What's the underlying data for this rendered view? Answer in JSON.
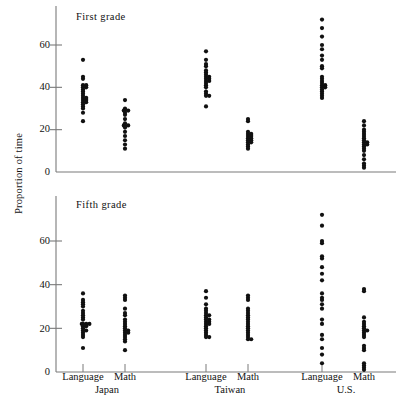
{
  "figure": {
    "ylabel": "Proportion of time",
    "panels": [
      {
        "id": "first",
        "title": "First grade"
      },
      {
        "id": "fifth",
        "title": "Fifth grade"
      }
    ],
    "ytick_labels": [
      "0",
      "20",
      "40",
      "60"
    ],
    "group_labels": [
      "Language",
      "Math",
      "Language",
      "Math",
      "Language",
      "Math"
    ],
    "country_labels": [
      "Japan",
      "Taiwan",
      "U.S."
    ],
    "axis_color": "#7a7a7a",
    "dot_color": "#111111"
  },
  "chart_data": {
    "type": "scatter",
    "xlabel": "",
    "ylabel": "Proportion of time",
    "ylim": [
      0,
      72
    ],
    "yticks": [
      0,
      20,
      40,
      60
    ],
    "grid": false,
    "legend": "none",
    "panels": [
      {
        "name": "First grade",
        "series": [
          {
            "name": "Japan Language",
            "country": "Japan",
            "subject": "Language",
            "x_position": 1,
            "values": [
              53,
              45,
              44,
              41,
              41,
              40,
              40,
              39,
              38,
              37,
              36,
              35,
              35,
              34,
              34,
              33,
              33,
              32,
              31,
              30,
              28,
              24
            ]
          },
          {
            "name": "Japan Math",
            "country": "Japan",
            "subject": "Math",
            "x_position": 2,
            "values": [
              34,
              30,
              29,
              29,
              29,
              28,
              27,
              25,
              23,
              22,
              22,
              22,
              21,
              19,
              17,
              15,
              13,
              11
            ]
          },
          {
            "name": "Taiwan Language",
            "country": "Taiwan",
            "subject": "Language",
            "x_position": 3,
            "values": [
              57,
              53,
              51,
              50,
              48,
              47,
              46,
              45,
              45,
              44,
              44,
              43,
              43,
              42,
              41,
              40,
              38,
              37,
              36,
              36,
              31
            ]
          },
          {
            "name": "Taiwan Math",
            "country": "Taiwan",
            "subject": "Math",
            "x_position": 4,
            "values": [
              25,
              24,
              19,
              18,
              18,
              17,
              17,
              16,
              16,
              15,
              15,
              14,
              14,
              13,
              12,
              11
            ]
          },
          {
            "name": "U.S. Language",
            "country": "U.S.",
            "subject": "Language",
            "x_position": 5,
            "values": [
              72,
              68,
              64,
              60,
              58,
              55,
              53,
              50,
              49,
              45,
              44,
              43,
              42,
              41,
              41,
              40,
              40,
              39,
              38,
              37,
              36,
              35
            ]
          },
          {
            "name": "U.S. Math",
            "country": "U.S.",
            "subject": "Math",
            "x_position": 6,
            "values": [
              24,
              22,
              20,
              19,
              18,
              17,
              16,
              15,
              14,
              14,
              13,
              13,
              12,
              11,
              10,
              8,
              6,
              4,
              3,
              2
            ]
          }
        ]
      },
      {
        "name": "Fifth grade",
        "series": [
          {
            "name": "Japan Language",
            "country": "Japan",
            "subject": "Language",
            "x_position": 1,
            "values": [
              36,
              33,
              32,
              31,
              30,
              28,
              27,
              26,
              25,
              24,
              22,
              22,
              22,
              22,
              21,
              21,
              20,
              19,
              19,
              18,
              17,
              16,
              11
            ]
          },
          {
            "name": "Japan Math",
            "country": "Japan",
            "subject": "Math",
            "x_position": 2,
            "values": [
              35,
              34,
              33,
              29,
              27,
              26,
              24,
              23,
              22,
              21,
              20,
              19,
              19,
              18,
              18,
              17,
              16,
              15,
              14,
              10
            ]
          },
          {
            "name": "Taiwan Language",
            "country": "Taiwan",
            "subject": "Language",
            "x_position": 3,
            "values": [
              37,
              34,
              31,
              29,
              28,
              27,
              26,
              26,
              25,
              24,
              24,
              23,
              23,
              22,
              22,
              21,
              20,
              19,
              18,
              17,
              16,
              16
            ]
          },
          {
            "name": "Taiwan Math",
            "country": "Taiwan",
            "subject": "Math",
            "x_position": 4,
            "values": [
              35,
              34,
              33,
              29,
              28,
              27,
              26,
              25,
              24,
              23,
              22,
              21,
              20,
              19,
              18,
              17,
              16,
              15,
              15
            ]
          },
          {
            "name": "U.S. Language",
            "country": "U.S.",
            "subject": "Language",
            "x_position": 5,
            "values": [
              72,
              67,
              60,
              59,
              53,
              52,
              48,
              45,
              42,
              36,
              34,
              33,
              31,
              29,
              24,
              22,
              17,
              15,
              11,
              8,
              4
            ]
          },
          {
            "name": "U.S. Math",
            "country": "U.S.",
            "subject": "Math",
            "x_position": 6,
            "values": [
              38,
              37,
              25,
              23,
              22,
              21,
              20,
              19,
              19,
              18,
              17,
              16,
              12,
              11,
              10,
              4,
              3,
              2,
              1
            ]
          }
        ]
      }
    ]
  }
}
